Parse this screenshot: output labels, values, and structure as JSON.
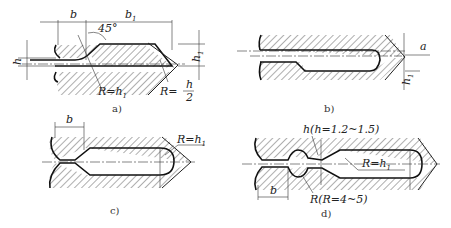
{
  "figures": [
    {
      "id": "a",
      "caption": "a)",
      "labels": {
        "b": "b",
        "b1": "b",
        "b1_sub": "1",
        "angle": "45°",
        "h": "h",
        "h1": "h",
        "h1_sub": "1",
        "radius1": "R=h",
        "radius1_sub": "1",
        "radius2_prefix": "R=",
        "radius2_num": "h",
        "radius2_den": "2"
      }
    },
    {
      "id": "b",
      "caption": "b)",
      "labels": {
        "a": "a",
        "h1": "h",
        "h1_sub": "1"
      }
    },
    {
      "id": "c",
      "caption": "c)",
      "labels": {
        "b": "b",
        "radius": "R=h",
        "radius_sub": "1"
      }
    },
    {
      "id": "d",
      "caption": "d)",
      "labels": {
        "h_note": "h(h=1.2~1.5)",
        "radius_main": "R=h",
        "radius_main_sub": "1",
        "radius_small": "R(R=4~5)",
        "b": "b"
      }
    }
  ]
}
